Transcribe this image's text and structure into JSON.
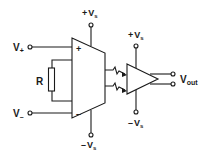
{
  "diagram": {
    "type": "circuit-schematic",
    "title": "",
    "colors": {
      "line": "#1a1a1a",
      "background": "#ffffff"
    },
    "inputs": {
      "v_plus": {
        "label": "V",
        "sub": "+"
      },
      "v_minus": {
        "label": "V",
        "sub": "–"
      }
    },
    "resistor": {
      "label": "R"
    },
    "amp1": {
      "plus_sign": "+",
      "minus_sign": "–"
    },
    "amp1_supply": {
      "top": {
        "sign": "+",
        "label": "V",
        "sub": "s"
      },
      "bottom": {
        "sign": "–",
        "label": "V",
        "sub": "s"
      }
    },
    "amp2_supply": {
      "top": {
        "sign": "+",
        "label": "V",
        "sub": "s"
      },
      "bottom": {
        "sign": "–",
        "label": "V",
        "sub": "s"
      }
    },
    "output": {
      "label": "V",
      "sub": "out"
    },
    "components": [
      "instrumentation-amplifier",
      "gain-resistor",
      "isolation-optical-coupling",
      "output-amplifier"
    ]
  }
}
